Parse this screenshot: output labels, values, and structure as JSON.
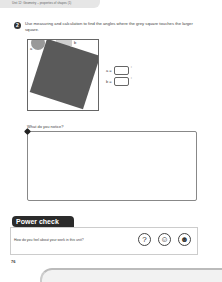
{
  "header": {
    "unit_title": "Unit 12: Geometry – properties of shapes (1)"
  },
  "question": {
    "number": "2",
    "text": "Use measuring and calculation to find the angles where the grey square touches the larger square.",
    "figure": {
      "label_a": "a",
      "label_b": "b"
    },
    "answers": [
      {
        "label": "a =",
        "value": "",
        "unit": "°"
      },
      {
        "label": "b =",
        "value": "",
        "unit": "°"
      }
    ]
  },
  "notice": {
    "label": "What do you notice?",
    "value": ""
  },
  "power_check": {
    "title": "Power check",
    "question": "How do you feel about your work in this unit?",
    "faces": [
      "unsure-face",
      "smile-face",
      "big-smile-face"
    ]
  },
  "page_number": "76"
}
